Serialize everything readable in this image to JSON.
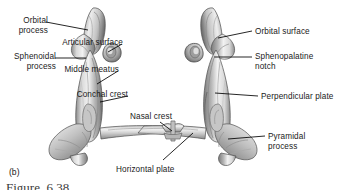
{
  "figure": {
    "panel_letter": "(b)",
    "caption_partial": "Figure  6.38",
    "background_color": "#ffffff",
    "text_color": "#1a1a1a",
    "leader_color": "#000000",
    "bone_light": "#efefef",
    "bone_mid": "#b8b8b8",
    "bone_dark": "#6e6e6e",
    "bone_outline": "#4a4a4a"
  },
  "labels": {
    "orbital_process": "Orbital\nprocess",
    "sphenoidal_process": "Sphenoidal\nprocess",
    "articular_surface": "Articular surface",
    "middle_meatus": "Middle meatus",
    "conchal_crest": "Conchal crest",
    "nasal_crest": "Nasal crest",
    "horizontal_plate": "Horizontal plate",
    "orbital_surface": "Orbital surface",
    "sphenopalatine_notch": "Sphenopalatine\nnotch",
    "perpendicular_plate": "Perpendicular plate",
    "pyramidal_process": "Pyramidal\nprocess"
  }
}
